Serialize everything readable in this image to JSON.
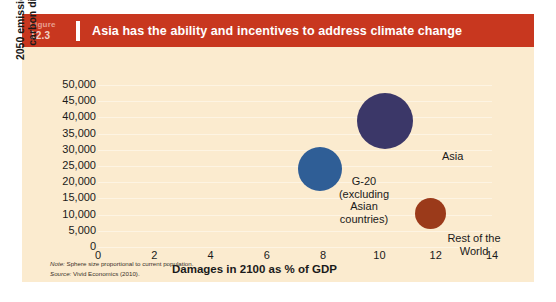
{
  "figure": {
    "label_word": "Figure",
    "number": "12.3",
    "title": "Asia has the ability and incentives to address climate change"
  },
  "footnotes": {
    "note_prefix": "Note:",
    "note_text": " Sphere size proportional to current population.",
    "source_prefix": "Source:",
    "source_text": " Vivid Economics (2010)."
  },
  "chart_data": {
    "type": "scatter",
    "title": "Asia has the ability and incentives to address climate change",
    "xlabel": "Damages in 2100 as % of GDP",
    "ylabel": "2050 emissions, megatonnes of carbon dioxide equivalent",
    "xlim": [
      0,
      14
    ],
    "ylim": [
      0,
      50000
    ],
    "xticks": [
      "0",
      "2",
      "4",
      "6",
      "8",
      "10",
      "12",
      "14"
    ],
    "xtick_values": [
      0,
      2,
      4,
      6,
      8,
      10,
      12,
      14
    ],
    "yticks": [
      "0",
      "5,000",
      "10,000",
      "15,000",
      "20,000",
      "25,000",
      "30,000",
      "35,000",
      "40,000",
      "45,000",
      "50,000"
    ],
    "ytick_values": [
      0,
      5000,
      10000,
      15000,
      20000,
      25000,
      30000,
      35000,
      40000,
      45000,
      50000
    ],
    "grid": true,
    "legend": "none",
    "size_note": "Sphere size proportional to current population.",
    "points": [
      {
        "name": "Asia",
        "label": "Asia",
        "x": 10.2,
        "y": 39000,
        "size": 56,
        "color": "#3b3768",
        "label_align": "left",
        "label_x": 420,
        "label_y": 103
      },
      {
        "name": "G-20 (excluding Asian countries)",
        "label": "G-20\n(excluding\nAsian\ncountries)",
        "x": 7.9,
        "y": 24000,
        "size": 44,
        "color": "#2f5e96",
        "label_align": "center",
        "label_x": 342,
        "label_y": 128
      },
      {
        "name": "Rest of the World",
        "label": "Rest of the\nWorld",
        "x": 11.8,
        "y": 10200,
        "size": 31,
        "color": "#9b3a1a",
        "label_align": "center",
        "label_x": 452,
        "label_y": 185
      }
    ]
  },
  "colors": {
    "header_band": "#c8371f",
    "card_background": "#fbebcf",
    "gridline": "#fdf6e6",
    "text": "#1a1a1a",
    "asia": "#3b3768",
    "g20": "#2f5e96",
    "rest_of_world": "#9b3a1a"
  }
}
